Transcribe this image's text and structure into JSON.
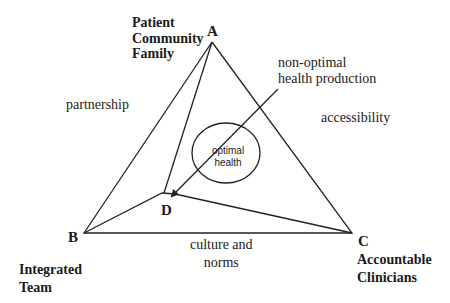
{
  "vertices": {
    "A": {
      "letter": "A",
      "lines": [
        "Patient",
        "Community",
        "Family"
      ]
    },
    "B": {
      "letter": "B",
      "lines": [
        "Integrated",
        "Team"
      ]
    },
    "C": {
      "letter": "C",
      "lines": [
        "Accountable",
        "Clinicians"
      ]
    },
    "D": {
      "letter": "D"
    }
  },
  "edges": {
    "AB": "partnership",
    "AC": "accessibility",
    "BC": [
      "culture and",
      "norms"
    ]
  },
  "arrow_label": [
    "non-optimal",
    "health production"
  ],
  "center": [
    "optimal",
    "health"
  ],
  "colors": {
    "line": "#222222",
    "text": "#1a1a1a",
    "background": "#ffffff"
  }
}
